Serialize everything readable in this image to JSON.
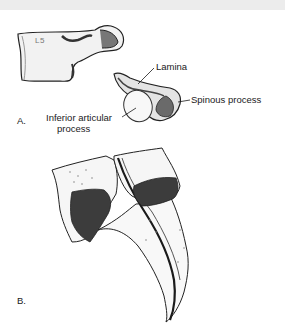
{
  "figure": {
    "panel_a": {
      "letter": "A.",
      "vertebra_label": "L5",
      "labels": {
        "lamina": "Lamina",
        "spinous_process": "Spinous process",
        "inferior_articular_line1": "Inferior articular",
        "inferior_articular_line2": "process"
      }
    },
    "panel_b": {
      "letter": "B."
    }
  },
  "colors": {
    "topbar": "#ececec",
    "ink": "#1a1a1a",
    "shade_dark": "#3a3a3a",
    "bone_fill": "#f4f4f4"
  }
}
